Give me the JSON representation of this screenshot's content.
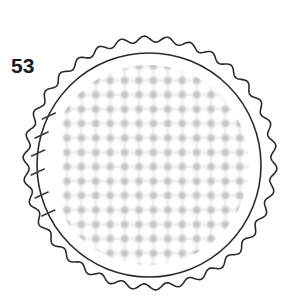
{
  "figure": {
    "number_label": "53"
  },
  "diagram": {
    "outer_fluted_circle": {
      "center": [
        150,
        163
      ],
      "radius": 124,
      "scallop_count": 34,
      "scallop_amplitude": 3,
      "stroke": "#2a2a2a"
    },
    "inner_circle": {
      "center": [
        149,
        165
      ],
      "radius": 112,
      "stroke": "#2a2a2a"
    },
    "dot_grid": {
      "spacing": 14.4,
      "origin": [
        67,
        66
      ],
      "dot_color": "#c4c4c4",
      "dot_size": 7,
      "clip_radius": 100
    },
    "tick_marks": {
      "count": 6,
      "y_positions": [
        116,
        135,
        153,
        172,
        195,
        213
      ],
      "stroke": "#3a3a3a"
    }
  }
}
